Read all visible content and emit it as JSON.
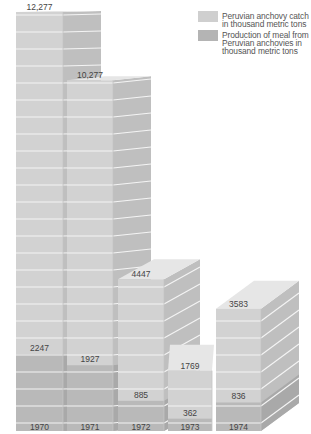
{
  "chart_data": {
    "type": "bar",
    "style": "3d-stacked-overlay",
    "title": "",
    "xlabel": "",
    "ylabel": "",
    "categories": [
      "1970",
      "1971",
      "1972",
      "1973",
      "1974"
    ],
    "series": [
      {
        "name": "Peruvian anchovy catch in thousand metric tons",
        "values": [
          12277,
          10277,
          4447,
          1769,
          3583
        ],
        "labels": [
          "12,277",
          "10,277",
          "4447",
          "1769",
          "3583"
        ],
        "color": "#cfcfcf"
      },
      {
        "name": "Production of meal from Peruvian anchovies in thousand metric tons",
        "values": [
          2247,
          1927,
          885,
          362,
          836
        ],
        "labels": [
          "2247",
          "1927",
          "885",
          "362",
          "836"
        ],
        "color": "#b4b4b4"
      }
    ],
    "legend_position": "top-right",
    "grid": false
  },
  "legend": {
    "items": [
      {
        "label": "Peruvian anchovy catch\nin thousand metric tons",
        "color": "#cfcfcf"
      },
      {
        "label": "Production of meal from\nPeruvian anchovies in\nthousand metric tons",
        "color": "#b4b4b4"
      }
    ]
  },
  "colors": {
    "catch_front": "#d2d2d2",
    "catch_side": "#bfbfbf",
    "catch_top": "#e6e6e6",
    "meal_front": "#b9b9b9",
    "meal_side": "#a9a9a9",
    "stripe": "#f4f4f4",
    "text": "#444444"
  }
}
